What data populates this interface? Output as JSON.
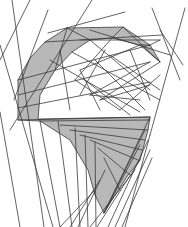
{
  "figure": {
    "width": 188,
    "height": 227,
    "colors": {
      "background": "#ffffff",
      "line": "#3a3a3a",
      "light_line": "#6a6a6a",
      "shade": "#b8b8b8"
    },
    "shaded_polygons": [
      "67,28 123,27 150,45 160,62 140,45 112,38 90,40 72,52 55,70 40,95 38,119 150,117 148,130 140,160 128,175 112,200 104,213 95,195 88,170 70,140 40,121 18,120 18,80 30,58 45,42"
    ],
    "lines": [
      [
        0,
        45,
        53,
        227
      ],
      [
        0,
        112,
        20,
        227
      ],
      [
        12,
        0,
        44,
        227
      ],
      [
        0,
        60,
        30,
        0
      ],
      [
        14,
        100,
        48,
        10
      ],
      [
        10,
        130,
        92,
        0
      ],
      [
        48,
        33,
        125,
        12
      ],
      [
        45,
        42,
        162,
        35
      ],
      [
        185,
        8,
        150,
        135
      ],
      [
        150,
        135,
        125,
        227
      ],
      [
        160,
        40,
        150,
        45
      ],
      [
        160,
        30,
        183,
        65
      ],
      [
        152,
        8,
        180,
        80
      ],
      [
        18,
        80,
        150,
        45
      ],
      [
        18,
        95,
        150,
        62
      ],
      [
        18,
        108,
        150,
        82
      ],
      [
        18,
        120,
        150,
        117
      ],
      [
        40,
        121,
        150,
        120
      ],
      [
        60,
        125,
        148,
        130
      ],
      [
        70,
        130,
        145,
        140
      ],
      [
        80,
        135,
        142,
        150
      ],
      [
        90,
        140,
        138,
        160
      ],
      [
        98,
        148,
        130,
        175
      ],
      [
        104,
        158,
        120,
        190
      ],
      [
        104,
        213,
        150,
        117
      ],
      [
        104,
        213,
        145,
        130
      ],
      [
        104,
        213,
        140,
        145
      ],
      [
        108,
        227,
        148,
        140
      ],
      [
        115,
        227,
        150,
        150
      ],
      [
        122,
        227,
        152,
        158
      ],
      [
        97,
        227,
        140,
        160
      ],
      [
        90,
        227,
        135,
        170
      ],
      [
        40,
        121,
        60,
        227
      ],
      [
        58,
        121,
        72,
        227
      ],
      [
        75,
        128,
        80,
        227
      ],
      [
        85,
        135,
        88,
        227
      ],
      [
        95,
        142,
        96,
        227
      ],
      [
        60,
        227,
        95,
        190
      ],
      [
        70,
        227,
        100,
        180
      ],
      [
        78,
        227,
        105,
        170
      ],
      [
        67,
        28,
        55,
        70
      ],
      [
        67,
        28,
        90,
        40
      ],
      [
        123,
        27,
        112,
        38
      ],
      [
        123,
        27,
        160,
        62
      ],
      [
        150,
        45,
        140,
        45
      ],
      [
        90,
        40,
        150,
        90
      ],
      [
        72,
        52,
        160,
        100
      ],
      [
        112,
        38,
        75,
        80
      ],
      [
        140,
        45,
        80,
        70
      ],
      [
        150,
        62,
        90,
        95
      ],
      [
        160,
        62,
        100,
        100
      ],
      [
        80,
        70,
        100,
        110
      ],
      [
        75,
        80,
        120,
        110
      ],
      [
        90,
        95,
        140,
        100
      ],
      [
        100,
        100,
        150,
        85
      ],
      [
        120,
        110,
        160,
        75
      ],
      [
        110,
        55,
        160,
        90
      ],
      [
        130,
        50,
        150,
        100
      ],
      [
        95,
        60,
        145,
        110
      ],
      [
        85,
        80,
        130,
        115
      ],
      [
        105,
        50,
        80,
        95
      ],
      [
        80,
        40,
        160,
        40
      ],
      [
        90,
        30,
        170,
        55
      ],
      [
        60,
        50,
        70,
        110
      ],
      [
        50,
        60,
        140,
        112
      ]
    ]
  }
}
